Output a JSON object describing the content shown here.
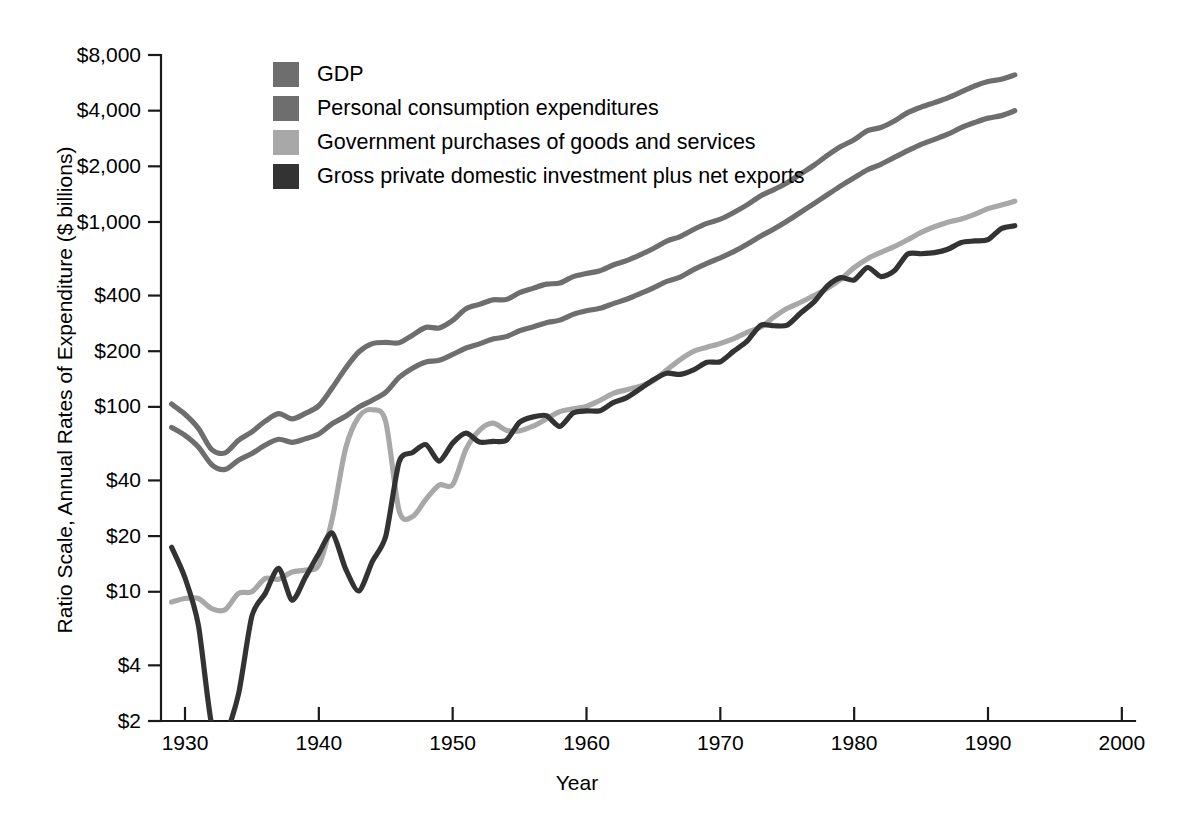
{
  "chart_data": {
    "type": "line",
    "title": "",
    "subtitle": "",
    "xlabel": "Year",
    "ylabel": "Ratio Scale, Annual Rates of Expenditure ($ billions)",
    "scale": "log",
    "grid": false,
    "legend_position": "top-left-inside",
    "xlim": [
      1929,
      2000
    ],
    "ylim": [
      2,
      8000
    ],
    "x_ticks": [
      1930,
      1940,
      1950,
      1960,
      1970,
      1980,
      1990,
      2000
    ],
    "x_tick_labels": [
      "1930",
      "1940",
      "1950",
      "1960",
      "1970",
      "1980",
      "1990",
      "2000"
    ],
    "y_ticks": [
      2,
      4,
      10,
      20,
      40,
      100,
      200,
      400,
      1000,
      2000,
      4000,
      8000
    ],
    "y_tick_labels": [
      "$2",
      "$4",
      "$10",
      "$20",
      "$40",
      "$100",
      "$200",
      "$400",
      "$1,000",
      "$2,000",
      "$4,000",
      "$8,000"
    ],
    "annotations": [],
    "series": [
      {
        "name": "GDP",
        "color": "#6e6e6e",
        "x": [
          1929,
          1930,
          1931,
          1932,
          1933,
          1934,
          1935,
          1936,
          1937,
          1938,
          1939,
          1940,
          1941,
          1942,
          1943,
          1944,
          1945,
          1946,
          1947,
          1948,
          1949,
          1950,
          1951,
          1952,
          1953,
          1954,
          1955,
          1956,
          1957,
          1958,
          1959,
          1960,
          1961,
          1962,
          1963,
          1964,
          1965,
          1966,
          1967,
          1968,
          1969,
          1970,
          1971,
          1972,
          1973,
          1974,
          1975,
          1976,
          1977,
          1978,
          1979,
          1980,
          1981,
          1982,
          1983,
          1984,
          1985,
          1986,
          1987,
          1988,
          1989,
          1990,
          1991,
          1992
        ],
        "y": [
          103.6,
          91.2,
          76.5,
          58.7,
          56.4,
          66.0,
          73.3,
          83.8,
          91.9,
          86.1,
          92.2,
          101.4,
          126.7,
          161.9,
          198.6,
          219.8,
          223.0,
          222.2,
          244.1,
          269.1,
          267.2,
          293.7,
          339.3,
          358.3,
          379.3,
          380.4,
          414.7,
          437.4,
          461.1,
          467.2,
          506.6,
          526.4,
          544.7,
          585.6,
          617.7,
          663.6,
          719.1,
          787.8,
          833.6,
          910.6,
          982.2,
          1035.6,
          1125.4,
          1237.3,
          1382.6,
          1496.9,
          1630.6,
          1819.0,
          2026.9,
          2291.4,
          2557.5,
          2784.2,
          3115.9,
          3242.1,
          3514.5,
          3902.4,
          4180.7,
          4422.2,
          4692.3,
          5049.6,
          5438.7,
          5743.8,
          5916.7,
          6244.4
        ]
      },
      {
        "name": "Personal consumption expenditures",
        "color": "#6e6e6e",
        "x": [
          1929,
          1930,
          1931,
          1932,
          1933,
          1934,
          1935,
          1936,
          1937,
          1938,
          1939,
          1940,
          1941,
          1942,
          1943,
          1944,
          1945,
          1946,
          1947,
          1948,
          1949,
          1950,
          1951,
          1952,
          1953,
          1954,
          1955,
          1956,
          1957,
          1958,
          1959,
          1960,
          1961,
          1962,
          1963,
          1964,
          1965,
          1966,
          1967,
          1968,
          1969,
          1970,
          1971,
          1972,
          1973,
          1974,
          1975,
          1976,
          1977,
          1978,
          1979,
          1980,
          1981,
          1982,
          1983,
          1984,
          1985,
          1986,
          1987,
          1988,
          1989,
          1990,
          1991,
          1992
        ],
        "y": [
          77.4,
          70.1,
          60.7,
          48.7,
          45.9,
          51.5,
          55.9,
          62.2,
          66.8,
          64.3,
          67.2,
          71.3,
          81.1,
          89.0,
          99.9,
          108.7,
          120.0,
          144.3,
          162.0,
          175.0,
          178.5,
          192.1,
          208.1,
          219.1,
          232.6,
          239.8,
          257.9,
          270.6,
          285.3,
          294.6,
          316.3,
          330.7,
          341.1,
          361.9,
          381.7,
          409.3,
          440.7,
          477.3,
          503.6,
          552.5,
          597.9,
          640.0,
          691.6,
          757.6,
          837.2,
          916.5,
          1012.8,
          1129.3,
          1257.2,
          1403.5,
          1566.8,
          1732.6,
          1915.1,
          2050.7,
          2234.5,
          2430.5,
          2629.0,
          2797.4,
          2982.6,
          3238.2,
          3450.1,
          3644.0,
          3760.5,
          3995.2
        ]
      },
      {
        "name": "Government purchases of goods and services",
        "color": "#a8a8a8",
        "x": [
          1929,
          1930,
          1931,
          1932,
          1933,
          1934,
          1935,
          1936,
          1937,
          1938,
          1939,
          1940,
          1941,
          1942,
          1943,
          1944,
          1945,
          1946,
          1947,
          1948,
          1949,
          1950,
          1951,
          1952,
          1953,
          1954,
          1955,
          1956,
          1957,
          1958,
          1959,
          1960,
          1961,
          1962,
          1963,
          1964,
          1965,
          1966,
          1967,
          1968,
          1969,
          1970,
          1971,
          1972,
          1973,
          1974,
          1975,
          1976,
          1977,
          1978,
          1979,
          1980,
          1981,
          1982,
          1983,
          1984,
          1985,
          1986,
          1987,
          1988,
          1989,
          1990,
          1991,
          1992
        ],
        "y": [
          8.8,
          9.2,
          9.2,
          8.1,
          8.0,
          9.8,
          10.0,
          11.8,
          11.7,
          12.8,
          13.1,
          14.0,
          24.8,
          59.6,
          88.6,
          96.5,
          83.0,
          27.4,
          25.5,
          31.6,
          37.8,
          37.9,
          59.1,
          74.7,
          81.6,
          74.8,
          74.2,
          78.6,
          86.1,
          94.2,
          97.6,
          100.6,
          108.3,
          118.2,
          123.8,
          129.3,
          138.4,
          158.6,
          180.2,
          199.6,
          210.0,
          220.2,
          233.7,
          253.1,
          269.5,
          305.7,
          341.1,
          368.0,
          400.2,
          437.3,
          490.7,
          566.1,
          633.4,
          684.8,
          735.7,
          800.8,
          878.3,
          942.3,
          997.9,
          1036.9,
          1099.1,
          1180.9,
          1235.5,
          1295.0
        ]
      },
      {
        "name": "Gross private domestic investment plus net exports",
        "color": "#333333",
        "x": [
          1929,
          1930,
          1931,
          1932,
          1933,
          1934,
          1935,
          1936,
          1937,
          1938,
          1939,
          1940,
          1941,
          1942,
          1943,
          1944,
          1945,
          1946,
          1947,
          1948,
          1949,
          1950,
          1951,
          1952,
          1953,
          1954,
          1955,
          1956,
          1957,
          1958,
          1959,
          1960,
          1961,
          1962,
          1963,
          1964,
          1965,
          1966,
          1967,
          1968,
          1969,
          1970,
          1971,
          1972,
          1973,
          1974,
          1975,
          1976,
          1977,
          1978,
          1979,
          1980,
          1981,
          1982,
          1983,
          1984,
          1985,
          1986,
          1987,
          1988,
          1989,
          1990,
          1991,
          1992
        ],
        "y": [
          17.4,
          11.9,
          6.6,
          1.9,
          1.7,
          2.8,
          7.4,
          9.8,
          13.4,
          9.0,
          12.0,
          16.1,
          20.8,
          13.3,
          10.1,
          14.6,
          20.0,
          50.5,
          56.6,
          62.5,
          50.9,
          63.7,
          72.1,
          64.5,
          65.1,
          65.8,
          82.6,
          88.2,
          89.7,
          78.4,
          92.7,
          95.1,
          95.3,
          105.5,
          112.2,
          125.0,
          140.0,
          151.9,
          149.8,
          158.5,
          174.3,
          175.4,
          200.1,
          226.6,
          275.9,
          274.7,
          276.7,
          321.7,
          369.5,
          450.6,
          500.0,
          485.5,
          567.4,
          506.6,
          544.3,
          671.1,
          673.4,
          682.5,
          711.8,
          774.5,
          789.5,
          802.4,
          921.2,
          954.2
        ]
      }
    ]
  },
  "legend": {
    "items": [
      {
        "label": "GDP",
        "color": "#6e6e6e"
      },
      {
        "label": "Personal consumption expenditures",
        "color": "#6e6e6e"
      },
      {
        "label": "Government purchases of goods and services",
        "color": "#a8a8a8"
      },
      {
        "label": "Gross private domestic investment plus net exports",
        "color": "#333333"
      }
    ]
  },
  "axes": {
    "y_label": "Ratio Scale, Annual Rates of Expenditure ($ billions)",
    "x_label": "Year"
  }
}
